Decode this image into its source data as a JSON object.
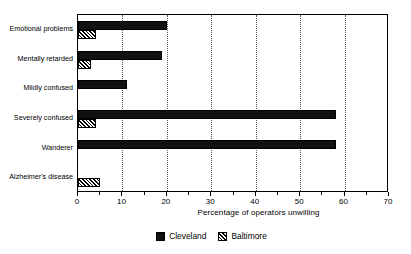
{
  "chart_data": {
    "type": "bar",
    "orientation": "horizontal",
    "title": "",
    "xlabel": "Percentage of operators unwilling",
    "ylabel": "",
    "xlim": [
      0,
      70
    ],
    "xticks": [
      0,
      10,
      20,
      30,
      40,
      50,
      60,
      70
    ],
    "xtick_labels": [
      "0",
      "10",
      "20",
      "30",
      "40",
      "50",
      "60",
      "70"
    ],
    "minor_xticks": [
      5,
      15,
      25,
      35,
      45,
      55,
      65
    ],
    "grid": "vertical-dotted-at-major-ticks",
    "legend_position": "bottom-center",
    "categories": [
      "Emotional problems",
      "Mentally retarded",
      "Mildly confused",
      "Severely confused",
      "Wanderer",
      "Alzheimer's disease"
    ],
    "series": [
      {
        "name": "Cleveland",
        "fill": "solid-black",
        "color": "#111111",
        "values": [
          20,
          19,
          11,
          58,
          58,
          0
        ]
      },
      {
        "name": "Baltimore",
        "fill": "diagonal-hatch",
        "color": "#ffffff",
        "values": [
          4,
          3,
          0,
          4,
          0,
          5
        ]
      }
    ]
  },
  "axis": {
    "x_title": "Percentage of operators unwilling",
    "ticks": [
      {
        "value": 0,
        "label": "0"
      },
      {
        "value": 10,
        "label": "10"
      },
      {
        "value": 20,
        "label": "20"
      },
      {
        "value": 30,
        "label": "30"
      },
      {
        "value": 40,
        "label": "40"
      },
      {
        "value": 50,
        "label": "50"
      },
      {
        "value": 60,
        "label": "60"
      },
      {
        "value": 70,
        "label": "70"
      }
    ]
  },
  "categories": [
    {
      "label": "Emotional problems"
    },
    {
      "label": "Mentally retarded"
    },
    {
      "label": "Mildly confused"
    },
    {
      "label": "Severely confused"
    },
    {
      "label": "Wanderer"
    },
    {
      "label": "Alzheimer's disease"
    }
  ],
  "legend": {
    "items": [
      {
        "label": "Cleveland",
        "style": "solid-black"
      },
      {
        "label": "Baltimore",
        "style": "diagonal-hatch"
      }
    ]
  },
  "colors": {
    "cleveland": "#111111",
    "baltimore": "#ffffff",
    "axis": "#000000",
    "grid": "#555555",
    "background": "#ffffff"
  }
}
